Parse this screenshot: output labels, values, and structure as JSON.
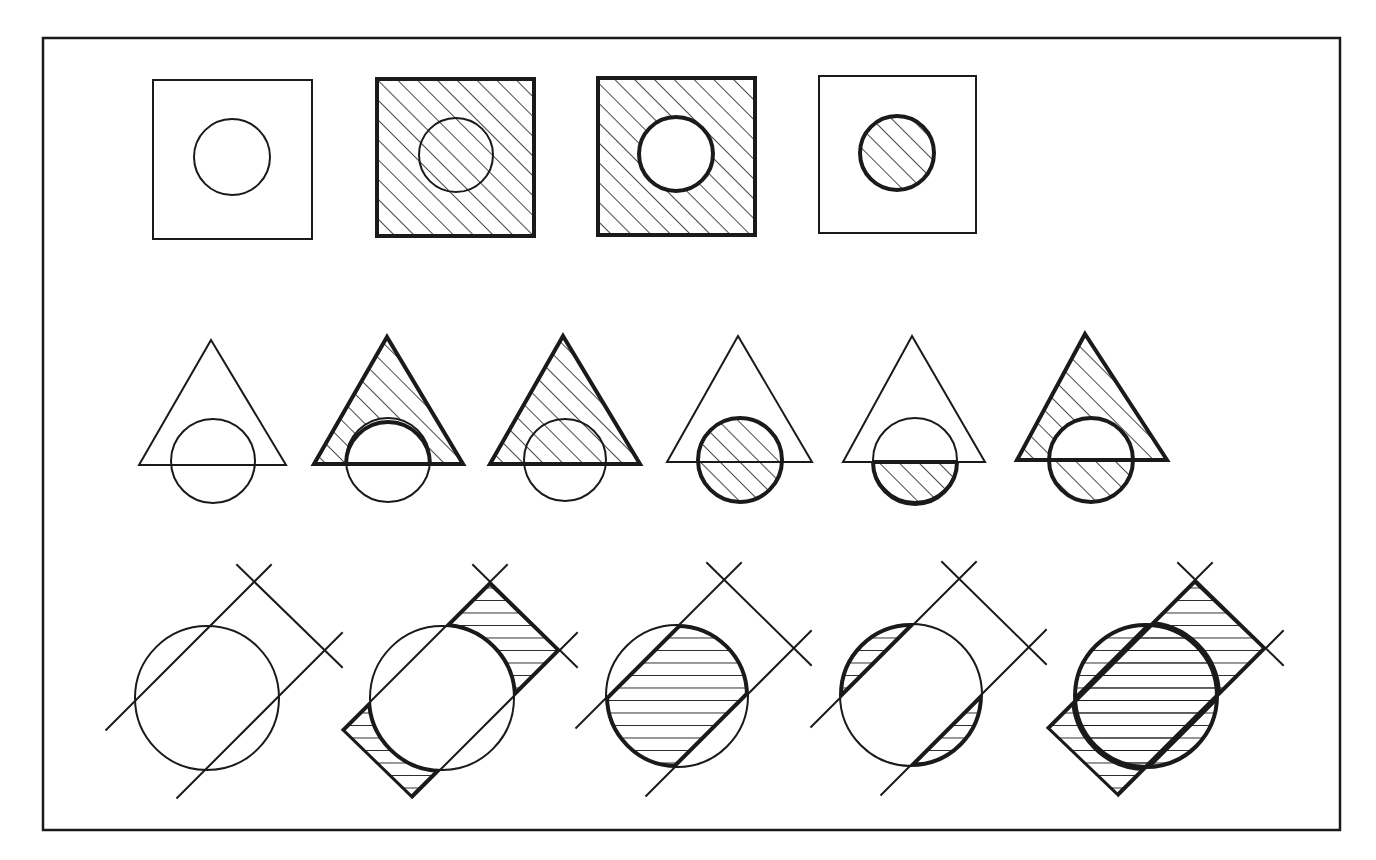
{
  "figure": {
    "title": "Set operations on shapes (hatched = selected region)",
    "frame": {
      "x": 43,
      "y": 38,
      "w": 1297,
      "h": 792
    },
    "colors": {
      "ink": "#1a1a1a",
      "paper": "#ffffff"
    },
    "row1_squares": [
      {
        "id": "sq1",
        "label": "square and circle, none shaded",
        "x": 153,
        "y": 80,
        "s": 159,
        "cx": 232,
        "cy": 157,
        "r": 38,
        "fill": "none",
        "bold_square": false,
        "bold_circle": false
      },
      {
        "id": "sq2",
        "label": "entire square shaded",
        "x": 377,
        "y": 79,
        "s": 157,
        "cx": 456,
        "cy": 155,
        "r": 37,
        "fill": "square",
        "bold_square": true,
        "bold_circle": false
      },
      {
        "id": "sq3",
        "label": "square minus circle shaded",
        "x": 598,
        "y": 78,
        "s": 157,
        "cx": 676,
        "cy": 154,
        "r": 37,
        "fill": "square-minus-circle",
        "bold_square": true,
        "bold_circle": true
      },
      {
        "id": "sq4",
        "label": "circle only shaded",
        "x": 819,
        "y": 76,
        "s": 157,
        "cx": 897,
        "cy": 153,
        "r": 37,
        "fill": "circle",
        "bold_square": false,
        "bold_circle": true
      }
    ],
    "row2_triangles": [
      {
        "id": "tr1",
        "label": "triangle and circle, none shaded",
        "apex": [
          211,
          340
        ],
        "left": [
          139,
          465
        ],
        "right": [
          286,
          465
        ],
        "cx": 213,
        "cy": 461,
        "r": 42,
        "fill": "none"
      },
      {
        "id": "tr2",
        "label": "triangle minus circle shaded",
        "apex": [
          387,
          337
        ],
        "left": [
          314,
          464
        ],
        "right": [
          463,
          464
        ],
        "cx": 388,
        "cy": 460,
        "r": 42,
        "fill": "triangle-minus-circle"
      },
      {
        "id": "tr3",
        "label": "entire triangle shaded",
        "apex": [
          563,
          336
        ],
        "left": [
          490,
          464
        ],
        "right": [
          640,
          464
        ],
        "cx": 565,
        "cy": 460,
        "r": 41,
        "fill": "triangle"
      },
      {
        "id": "tr4",
        "label": "circle shaded",
        "apex": [
          738,
          336
        ],
        "left": [
          667,
          462
        ],
        "right": [
          812,
          462
        ],
        "cx": 740,
        "cy": 460,
        "r": 42,
        "fill": "circle"
      },
      {
        "id": "tr5",
        "label": "circle minus triangle shaded",
        "apex": [
          912,
          336
        ],
        "left": [
          843,
          462
        ],
        "right": [
          985,
          462
        ],
        "cx": 915,
        "cy": 460,
        "r": 42,
        "fill": "circle-minus-triangle"
      },
      {
        "id": "tr6",
        "label": "symmetric difference shaded",
        "apex": [
          1085,
          334
        ],
        "left": [
          1017,
          460
        ],
        "right": [
          1167,
          460
        ],
        "cx": 1091,
        "cy": 460,
        "r": 42,
        "fill": "xor"
      }
    ],
    "row3_strips": [
      {
        "id": "st1",
        "label": "circle and strip, none shaded",
        "cx": 207,
        "cy": 698,
        "r": 72,
        "A": [
          254,
          582
        ],
        "B": [
          325,
          650
        ],
        "fill": "none"
      },
      {
        "id": "st2",
        "label": "strip minus circle shaded",
        "cx": 442,
        "cy": 698,
        "r": 72,
        "A": [
          490,
          582
        ],
        "B": [
          560,
          650
        ],
        "fill": "strip-minus-circle"
      },
      {
        "id": "st3",
        "label": "circle intersect strip shaded",
        "cx": 677,
        "cy": 696,
        "r": 71,
        "A": [
          724,
          580
        ],
        "B": [
          794,
          648
        ],
        "fill": "intersection"
      },
      {
        "id": "st4",
        "label": "circle minus strip shaded",
        "cx": 911,
        "cy": 695,
        "r": 71,
        "A": [
          959,
          579
        ],
        "B": [
          1029,
          647
        ],
        "fill": "circle-minus-strip"
      },
      {
        "id": "st5",
        "label": "union of circle and strip shaded",
        "cx": 1146,
        "cy": 696,
        "r": 72,
        "A": [
          1195,
          580
        ],
        "B": [
          1266,
          648
        ],
        "fill": "union"
      }
    ]
  }
}
